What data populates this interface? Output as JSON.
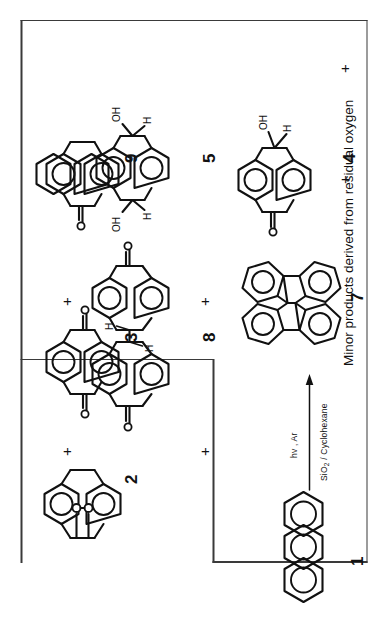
{
  "scheme": {
    "title_caption": "Minor products derived from residual oxygen",
    "reaction": {
      "arrow_top_label": "hv , Ar",
      "arrow_bottom_label_pre": "SiO",
      "arrow_bottom_label_sub": "2",
      "arrow_bottom_label_post": " / Cyclohexane",
      "arrow_name": "reaction-arrow"
    },
    "plus_symbol": "+",
    "reactants": [
      {
        "id": "1",
        "label": "1",
        "name": "anthracene",
        "structure": "anthracene"
      }
    ],
    "major_products": [
      {
        "id": "7",
        "label": "7",
        "name": "dianthracene-dimer",
        "structure": "dimer"
      }
    ],
    "minor_products": [
      {
        "id": "2",
        "label": "2",
        "name": "anthracene-endoperoxide",
        "structure": "endoperoxide",
        "atom_labels": [
          "O",
          "O"
        ]
      },
      {
        "id": "3",
        "label": "3",
        "name": "anthraquinone",
        "structure": "anthraquinone",
        "atom_labels": [
          "O",
          "O"
        ]
      },
      {
        "id": "9",
        "label": "9",
        "name": "anthrone",
        "structure": "anthrone",
        "atom_labels": [
          "O"
        ]
      },
      {
        "id": "8",
        "label": "8",
        "name": "bianthronyl-dimer",
        "structure": "bianthronyl",
        "atom_labels": [
          "O",
          "O",
          "H",
          "H"
        ]
      },
      {
        "id": "5",
        "label": "5",
        "name": "dihydroanthracene-diol",
        "structure": "diol",
        "atom_labels": [
          "OH",
          "OH",
          "H",
          "H"
        ]
      },
      {
        "id": "4",
        "label": "4",
        "name": "hydroxy-anthrone",
        "structure": "hydroxyanthrone",
        "atom_labels": [
          "O",
          "OH",
          "H"
        ]
      }
    ],
    "atoms": {
      "O": "O",
      "OH": "OH",
      "H": "H"
    },
    "colors": {
      "ink": "#111111",
      "box_border": "#3a3a3a",
      "background": "#ffffff"
    }
  }
}
